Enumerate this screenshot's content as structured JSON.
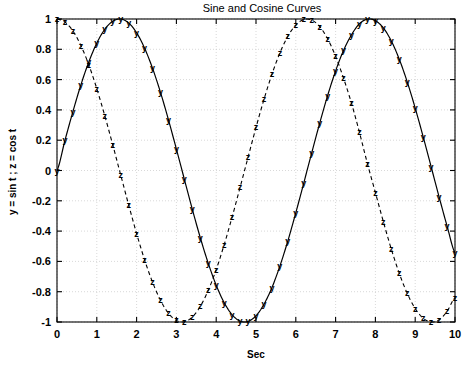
{
  "chart_data": {
    "type": "line",
    "title": "Sine and Cosine Curves",
    "xlabel": "Sec",
    "ylabel": "y = sin t ; z = cos t",
    "xlim": [
      0,
      10
    ],
    "ylim": [
      -1,
      1
    ],
    "grid": true,
    "legend": "none",
    "xticks": [
      "0",
      "1",
      "2",
      "3",
      "4",
      "5",
      "6",
      "7",
      "8",
      "9",
      "10"
    ],
    "xtick_values": [
      0,
      1,
      2,
      3,
      4,
      5,
      6,
      7,
      8,
      9,
      10
    ],
    "yticks": [
      "1",
      "0.8",
      "0.6",
      "0.4",
      "0.2",
      "0",
      "-0.2",
      "-0.4",
      "-0.6",
      "-0.8",
      "-1"
    ],
    "ytick_values": [
      1,
      0.8,
      0.6,
      0.4,
      0.2,
      0,
      -0.2,
      -0.4,
      -0.6,
      -0.8,
      -1
    ],
    "series": [
      {
        "name": "y = sin t",
        "style": "solid",
        "marker": "y",
        "color": "#000000",
        "x": [
          0,
          0.2,
          0.4,
          0.6,
          0.8,
          1.0,
          1.2,
          1.4,
          1.6,
          1.8,
          2.0,
          2.2,
          2.4,
          2.6,
          2.8,
          3.0,
          3.2,
          3.4,
          3.6,
          3.8,
          4.0,
          4.2,
          4.4,
          4.6,
          4.8,
          5.0,
          5.2,
          5.4,
          5.6,
          5.8,
          6.0,
          6.2,
          6.4,
          6.6,
          6.8,
          7.0,
          7.2,
          7.4,
          7.6,
          7.8,
          8.0,
          8.2,
          8.4,
          8.6,
          8.8,
          9.0,
          9.2,
          9.4,
          9.6,
          9.8,
          10.0
        ],
        "y": [
          0.0,
          0.199,
          0.389,
          0.565,
          0.717,
          0.841,
          0.932,
          0.985,
          1.0,
          0.974,
          0.909,
          0.808,
          0.675,
          0.516,
          0.335,
          0.141,
          -0.058,
          -0.256,
          -0.443,
          -0.612,
          -0.757,
          -0.872,
          -0.952,
          -0.994,
          -0.996,
          -0.959,
          -0.883,
          -0.773,
          -0.631,
          -0.465,
          -0.279,
          -0.083,
          0.117,
          0.312,
          0.495,
          0.657,
          0.793,
          0.896,
          0.969,
          0.999,
          0.989,
          0.941,
          0.855,
          0.734,
          0.585,
          0.412,
          0.223,
          0.025,
          -0.174,
          -0.366,
          -0.544
        ]
      },
      {
        "name": "z = cos t",
        "style": "dashed",
        "marker": "z",
        "color": "#000000",
        "x": [
          0,
          0.2,
          0.4,
          0.6,
          0.8,
          1.0,
          1.2,
          1.4,
          1.6,
          1.8,
          2.0,
          2.2,
          2.4,
          2.6,
          2.8,
          3.0,
          3.2,
          3.4,
          3.6,
          3.8,
          4.0,
          4.2,
          4.4,
          4.6,
          4.8,
          5.0,
          5.2,
          5.4,
          5.6,
          5.8,
          6.0,
          6.2,
          6.4,
          6.6,
          6.8,
          7.0,
          7.2,
          7.4,
          7.6,
          7.8,
          8.0,
          8.2,
          8.4,
          8.6,
          8.8,
          9.0,
          9.2,
          9.4,
          9.6,
          9.8,
          10.0
        ],
        "y": [
          1.0,
          0.98,
          0.921,
          0.825,
          0.697,
          0.54,
          0.362,
          0.17,
          -0.029,
          -0.227,
          -0.416,
          -0.589,
          -0.737,
          -0.857,
          -0.942,
          -0.99,
          -0.998,
          -0.967,
          -0.897,
          -0.791,
          -0.654,
          -0.49,
          -0.307,
          -0.112,
          0.087,
          0.284,
          0.469,
          0.635,
          0.776,
          0.886,
          0.96,
          0.997,
          0.993,
          0.95,
          0.869,
          0.754,
          0.609,
          0.443,
          0.251,
          0.045,
          -0.146,
          -0.338,
          -0.519,
          -0.679,
          -0.811,
          -0.911,
          -0.975,
          -1.0,
          -0.985,
          -0.93,
          -0.839
        ]
      }
    ]
  }
}
